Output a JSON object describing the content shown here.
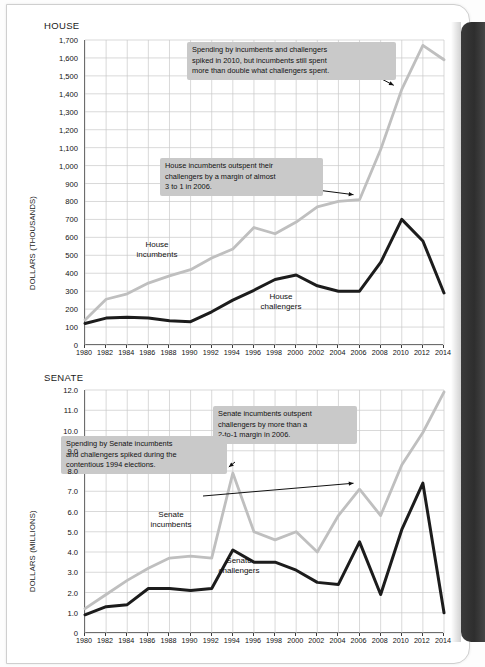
{
  "chart_data": [
    {
      "type": "line",
      "title": "HOUSE",
      "xlabel": "",
      "ylabel": "DOLLARS (THOUSANDS)",
      "x": [
        1980,
        1982,
        1984,
        1986,
        1988,
        1990,
        1992,
        1994,
        1996,
        1998,
        2000,
        2002,
        2004,
        2006,
        2008,
        2010,
        2012,
        2014
      ],
      "xticklabels": [
        "1980",
        "1982",
        "1984",
        "1986",
        "1988",
        "1990",
        "1992",
        "1994",
        "1996",
        "1998",
        "2000",
        "2002",
        "2004",
        "2006",
        "2008",
        "2010",
        "2012",
        "2014"
      ],
      "ylim": [
        0,
        1700
      ],
      "yticks": [
        0,
        100,
        200,
        300,
        400,
        500,
        600,
        700,
        800,
        900,
        1000,
        1100,
        1200,
        1300,
        1400,
        1500,
        1600,
        1700
      ],
      "yticklabels": [
        "0",
        "100",
        "200",
        "300",
        "400",
        "500",
        "600",
        "700",
        "800",
        "900",
        "1,000",
        "1,100",
        "1,200",
        "1,300",
        "1,400",
        "1,500",
        "1,600",
        "1,700"
      ],
      "grid": true,
      "legend": "inline-labels",
      "series": [
        {
          "name": "House incumbents",
          "color": "#bfbfbf",
          "values": [
            140,
            255,
            285,
            345,
            385,
            420,
            485,
            535,
            655,
            620,
            685,
            770,
            800,
            810,
            1090,
            1425,
            1670,
            1590
          ]
        },
        {
          "name": "House challengers",
          "color": "#1c1c1c",
          "values": [
            120,
            150,
            155,
            150,
            135,
            130,
            185,
            250,
            305,
            365,
            390,
            330,
            300,
            300,
            460,
            700,
            580,
            290
          ]
        }
      ],
      "annotations": [
        {
          "text": "Spending by incumbents and challengers\nspiked in 2010, but incumbents still spent\nmore than double what challengers spent.",
          "points_to": {
            "x": 2010,
            "y": 1425
          }
        },
        {
          "text": "House incumbents outspent their\nchallengers by a margin of almost\n3 to 1 in 2006.",
          "points_to": {
            "x": 2006,
            "y": 810
          }
        }
      ]
    },
    {
      "type": "line",
      "title": "SENATE",
      "xlabel": "",
      "ylabel": "DOLLARS (MILLIONS)",
      "x": [
        1980,
        1982,
        1984,
        1986,
        1988,
        1990,
        1992,
        1994,
        1996,
        1998,
        2000,
        2002,
        2004,
        2006,
        2008,
        2010,
        2012,
        2014
      ],
      "xticklabels": [
        "1980",
        "1982",
        "1984",
        "1986",
        "1988",
        "1990",
        "1992",
        "1994",
        "1996",
        "1998",
        "2000",
        "2002",
        "2004",
        "2006",
        "2008",
        "2010",
        "2012",
        "2014"
      ],
      "ylim": [
        0,
        12.0
      ],
      "yticks": [
        0,
        1,
        2,
        3,
        4,
        5,
        6,
        7,
        8,
        9,
        10,
        11,
        12
      ],
      "yticklabels": [
        "0",
        "1.0",
        "2.0",
        "3.0",
        "4.0",
        "5.0",
        "6.0",
        "7.0",
        "8.0",
        "9.0",
        "10.0",
        "11.0",
        "12.0"
      ],
      "grid": true,
      "legend": "inline-labels",
      "series": [
        {
          "name": "Senate incumbents",
          "color": "#bfbfbf",
          "values": [
            1.2,
            1.9,
            2.6,
            3.2,
            3.7,
            3.8,
            3.7,
            7.9,
            5.0,
            4.6,
            5.0,
            4.0,
            5.8,
            7.1,
            5.8,
            8.3,
            9.9,
            11.9
          ]
        },
        {
          "name": "Senate challengers",
          "color": "#1c1c1c",
          "values": [
            0.9,
            1.3,
            1.4,
            2.2,
            2.2,
            2.1,
            2.2,
            4.1,
            3.5,
            3.5,
            3.1,
            2.5,
            2.4,
            4.5,
            1.9,
            5.1,
            7.4,
            1.0
          ]
        }
      ],
      "annotations": [
        {
          "text": "Spending by Senate incumbents\nand challengers spiked during the\ncontentious 1994 elections.",
          "points_to": {
            "x": 1994,
            "y": 7.9
          }
        },
        {
          "text": "Senate incumbents outspent\nchallengers by more than a\n2-to-1 margin in 2006.",
          "points_to": {
            "x": 2006,
            "y": 7.1
          }
        }
      ]
    }
  ],
  "house": {
    "title": "HOUSE",
    "ylabel": "DOLLARS (THOUSANDS)",
    "series_label_incumbents": "House\nincumbents",
    "series_label_challengers": "House\nchallengers",
    "callout_1": "Spending by incumbents and challengers\nspiked in 2010, but incumbents still spent\nmore than double what challengers spent.",
    "callout_2": "House incumbents outspent their\nchallengers by a margin of almost\n3 to 1 in 2006."
  },
  "senate": {
    "title": "SENATE",
    "ylabel": "DOLLARS (MILLIONS)",
    "series_label_incumbents": "Senate\nincumbents",
    "series_label_challengers": "Senate\nchallengers",
    "callout_1": "Spending by Senate incumbents\nand challengers spiked during the\ncontentious 1994 elections.",
    "callout_2": "Senate incumbents outspent\nchallengers by more than a\n2-to-1 margin in 2006."
  },
  "colors": {
    "incumbents": "#bfbfbf",
    "challengers": "#1c1c1c",
    "grid": "#c8c8c8",
    "axis": "#3c3c3c",
    "callout_bg": "#c9c9c9"
  }
}
